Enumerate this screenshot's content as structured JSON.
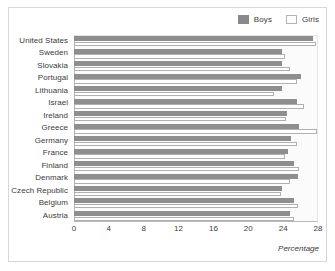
{
  "chart_data": {
    "type": "bar",
    "orientation": "horizontal",
    "title": "",
    "xlabel": "Percentage",
    "ylabel": "",
    "xlim": [
      0,
      28
    ],
    "xticks": [
      0,
      4,
      8,
      12,
      16,
      20,
      24,
      28
    ],
    "grid": false,
    "legend": {
      "position": "top-right",
      "entries": [
        {
          "name": "Boys",
          "color": "#8e8e8e",
          "style": "filled"
        },
        {
          "name": "Girls",
          "color": "#ffffff",
          "style": "outlined"
        }
      ]
    },
    "categories": [
      "United States",
      "Sweden",
      "Slovakia",
      "Portugal",
      "Lithuania",
      "Israel",
      "Ireland",
      "Greece",
      "Germany",
      "France",
      "Finland",
      "Denmark",
      "Czech Republic",
      "Belgium",
      "Austria"
    ],
    "series": [
      {
        "name": "Boys",
        "color": "#8e8e8e",
        "values": [
          27.4,
          23.9,
          23.9,
          26.1,
          23.9,
          25.6,
          24.4,
          25.8,
          24.9,
          24.6,
          25.2,
          25.7,
          23.9,
          25.3,
          24.8
        ]
      },
      {
        "name": "Girls",
        "color": "#ffffff",
        "values": [
          27.8,
          24.2,
          24.8,
          25.6,
          22.9,
          26.4,
          24.3,
          27.9,
          25.6,
          24.2,
          25.8,
          24.8,
          23.8,
          25.7,
          25.2
        ]
      }
    ]
  },
  "colors": {
    "boys": "#8e8e8e",
    "girls_fill": "#ffffff",
    "girls_edge": "#b0b0b0",
    "plot_background": "#fbfbfb",
    "axis": "#b9b9b9",
    "text": "#3b3b3b",
    "figure_border": "#d7d7d7"
  }
}
